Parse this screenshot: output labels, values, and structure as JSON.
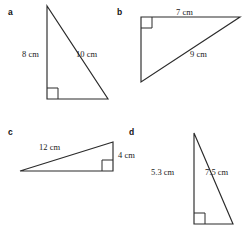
{
  "figures": [
    {
      "letter": "a",
      "letter_pos": {
        "x": 8,
        "y": 8
      },
      "labels": [
        {
          "name": "side-label-a-vertical",
          "text": "8 cm",
          "x": 22,
          "y": 50
        },
        {
          "name": "side-label-a-hypotenuse",
          "text": "10 cm",
          "x": 76,
          "y": 50
        }
      ]
    },
    {
      "letter": "b",
      "letter_pos": {
        "x": 117,
        "y": 8
      },
      "labels": [
        {
          "name": "side-label-b-top",
          "text": "7 cm",
          "x": 176,
          "y": 8
        },
        {
          "name": "side-label-b-hypotenuse",
          "text": "9 cm",
          "x": 190,
          "y": 50
        }
      ]
    },
    {
      "letter": "c",
      "letter_pos": {
        "x": 8,
        "y": 128
      },
      "labels": [
        {
          "name": "side-label-c-hypotenuse",
          "text": "12 cm",
          "x": 39,
          "y": 143
        },
        {
          "name": "side-label-c-vertical",
          "text": "4 cm",
          "x": 118,
          "y": 151
        }
      ]
    },
    {
      "letter": "d",
      "letter_pos": {
        "x": 129,
        "y": 128
      },
      "labels": [
        {
          "name": "side-label-d-vertical",
          "text": "5.3 cm",
          "x": 151,
          "y": 168
        },
        {
          "name": "side-label-d-hypotenuse",
          "text": "7.5 cm",
          "x": 205,
          "y": 168
        }
      ]
    }
  ],
  "geometry": {
    "stroke_color": "#2b2b2b",
    "triangle_a": {
      "points": "47,6 47,99 108,99",
      "right_angle": "47,88 58,88 58,99"
    },
    "triangle_b": {
      "points": "141,17 240,17 141,82",
      "right_angle": "152,17 152,28 141,28"
    },
    "triangle_c": {
      "points": "20,171 113,142 113,171",
      "right_angle": "102,171 102,160 113,160"
    },
    "triangle_d": {
      "points": "194,133 194,224 233,224",
      "right_angle": "194,213 205,213 205,224"
    }
  }
}
